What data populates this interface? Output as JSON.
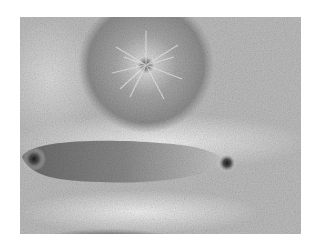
{
  "image": {
    "description": "Photograph of iron filings showing magnetic field patterns: a round magnet (top center) with radial spikes, an elongated bar-shaped region (middle-left) ending in a pole at right, and the top of a dark rounded magnet at bottom",
    "alt": "Iron filings magnetic field pattern"
  },
  "colors": {
    "background": "#ffffff",
    "filings_mid": "#b4b4b4",
    "filings_light": "#e6e6e6",
    "magnet_dark": "#555555",
    "magnet_darkest": "#222222"
  }
}
